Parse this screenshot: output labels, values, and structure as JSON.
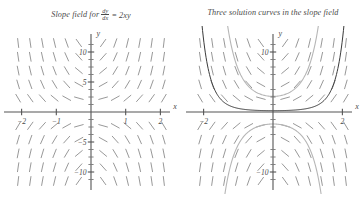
{
  "figure": {
    "background": "#ffffff",
    "ink": "#4a4a4a",
    "panels": [
      {
        "id": "slope-field",
        "caption_prefix": "Slope field for",
        "caption_numerator": "dy",
        "caption_denominator": "dx",
        "caption_equals": "=",
        "caption_rhs": "2xy",
        "axis_x_label": "x",
        "axis_y_label": "y",
        "x_tick_labels": [
          "−2",
          "−1",
          "1",
          "2"
        ],
        "y_tick_labels": [
          "10",
          "5",
          "−5",
          "−10"
        ]
      },
      {
        "id": "solution-curves",
        "caption_text": "Three solution curves in the slope field",
        "axis_x_label": "x",
        "axis_y_label": "y",
        "x_tick_labels": [
          "−2",
          "2"
        ],
        "y_tick_labels": [
          "10",
          "−10"
        ]
      }
    ]
  },
  "chart_data": [
    {
      "type": "line",
      "id": "slope-field",
      "title": "Slope field for dy/dx = 2xy",
      "equation": "dy/dx = 2xy",
      "xlabel": "x",
      "ylabel": "y",
      "xlim": [
        -2.45,
        2.45
      ],
      "ylim": [
        -13.0,
        13.0
      ],
      "grid": false,
      "legend": "none",
      "xticks": [
        -2,
        -1,
        1,
        2
      ],
      "xticklabels": [
        "−2",
        "−1",
        "1",
        "2"
      ],
      "yticks": [
        -10,
        -5,
        5,
        10
      ],
      "yticklabels": [
        "−10",
        "−5",
        "5",
        "10"
      ],
      "field": {
        "kind": "slope-field",
        "slope_formula": "2*x*y",
        "x_samples": [
          -2.1,
          -1.75,
          -1.4,
          -1.05,
          -0.7,
          -0.35,
          0.35,
          0.7,
          1.05,
          1.4,
          1.75,
          2.1
        ],
        "y_samples": [
          -11.5,
          -9.2,
          -6.9,
          -4.6,
          -2.3,
          2.3,
          4.6,
          6.9,
          9.2,
          11.5
        ],
        "tick_length_px": 9,
        "color": "#8c8c8c"
      }
    },
    {
      "type": "line",
      "id": "solution-curves",
      "title": "Three solution curves in the slope field",
      "equation": "y = C e^(x^2)",
      "xlabel": "x",
      "ylabel": "y",
      "xlim": [
        -2.45,
        2.45
      ],
      "ylim": [
        -13.0,
        13.0
      ],
      "grid": false,
      "legend": "none",
      "xticks": [
        -2,
        2
      ],
      "xticklabels": [
        "−2",
        "2"
      ],
      "yticks": [
        -10,
        10
      ],
      "yticklabels": [
        "−10",
        "10"
      ],
      "field": {
        "kind": "slope-field",
        "slope_formula": "2*x*y",
        "x_samples": [
          -2.1,
          -1.75,
          -1.4,
          -1.05,
          -0.7,
          -0.35,
          0.35,
          0.7,
          1.05,
          1.4,
          1.75,
          2.1
        ],
        "y_samples": [
          -11.5,
          -9.2,
          -6.9,
          -4.6,
          -2.3,
          2.3,
          4.6,
          6.9,
          9.2,
          11.5
        ],
        "tick_length_px": 9,
        "color": "#8c8c8c"
      },
      "series": [
        {
          "name": "upper-dark-curve",
          "C": 0.22,
          "color": "#3a3a3a",
          "width": 1.0
        },
        {
          "name": "upper-light-curve",
          "C": 2.6,
          "color": "#b6b6b6",
          "width": 1.1
        },
        {
          "name": "lower-light-curve",
          "C": -2.0,
          "color": "#b6b6b6",
          "width": 1.1
        }
      ]
    }
  ]
}
